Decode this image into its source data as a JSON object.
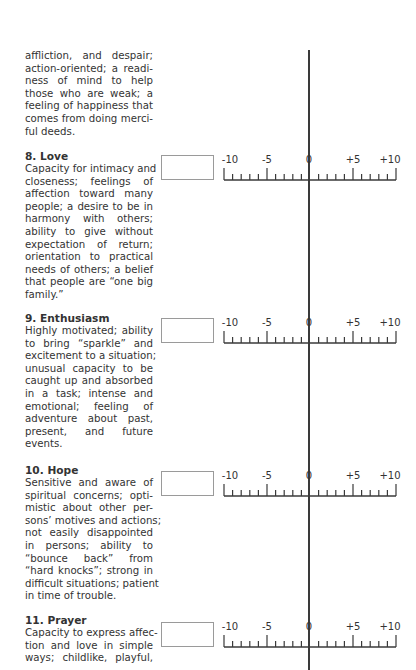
{
  "intro": {
    "lines": [
      "affliction, and despair;",
      "action-oriented; a readi-",
      "ness of mind to help",
      "those who are weak; a",
      "feeling of happiness that",
      "comes from doing merci-",
      "ful deeds."
    ]
  },
  "sections": [
    {
      "heading": "8. Love",
      "lines": [
        "Capacity for intimacy and",
        "closeness; feelings of",
        "affection toward many",
        "people; a desire to be in",
        "harmony with others;",
        "ability to give without",
        "expectation of return;",
        "orientation to practical",
        "needs of others; a belief",
        "that people are “one big",
        "family.”"
      ]
    },
    {
      "heading": "9. Enthusiasm",
      "lines": [
        "Highly motivated; ability",
        "to bring “sparkle” and",
        "excitement to a situation;",
        "unusual capacity to be",
        "caught up and absorbed",
        "in a task; intense and",
        "emotional; feeling of",
        "adventure about past,",
        "present, and future",
        "events."
      ]
    },
    {
      "heading": "10. Hope",
      "lines": [
        "Sensitive and aware of",
        "spiritual concerns; opti-",
        "mistic about other per-",
        "sons’ motives and actions;",
        "not easily disappointed",
        "in persons; ability to",
        "“bounce back” from",
        "“hard knocks”; strong in",
        "difficult situations; patient",
        "in time of trouble."
      ]
    },
    {
      "heading": "11. Prayer",
      "lines": [
        "Capacity to express affec-",
        "tion and love in simple",
        "ways; childlike, playful,"
      ]
    }
  ],
  "scale": {
    "labels": [
      "-10",
      "-5",
      "0",
      "+5",
      "+10"
    ],
    "score_boxes": [
      "",
      "",
      "",
      ""
    ]
  }
}
